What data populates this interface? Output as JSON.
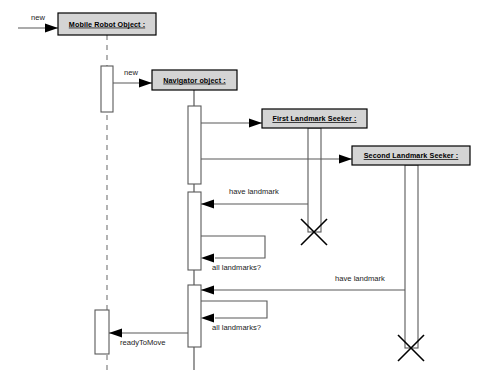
{
  "diagram": {
    "type": "uml-sequence-diagram",
    "width": 503,
    "height": 375,
    "background_color": "#ffffff",
    "colors": {
      "object_box_fill": "#d4d4d4",
      "object_box_stroke": "#000000",
      "activation_fill": "#ffffff",
      "activation_stroke": "#5a5a5a",
      "line": "#585858",
      "dashed_lifeline": "#8a8a8a",
      "arrowhead": "#000000",
      "text": "#1a1a1a"
    },
    "lifelines": [
      {
        "id": "mobile_robot",
        "label": "Mobile Robot Object :",
        "box": {
          "x": 58,
          "y": 13,
          "w": 98,
          "h": 22
        },
        "lifeline_x": 107,
        "lifeline_style": "dashed",
        "lifeline_top": 35,
        "lifeline_bottom": 370,
        "activations": [
          {
            "x": 101,
            "y": 66,
            "w": 12,
            "h": 46
          },
          {
            "x": 95,
            "y": 310,
            "w": 14,
            "h": 44
          }
        ]
      },
      {
        "id": "navigator",
        "label": "Navigator object :",
        "box": {
          "x": 152,
          "y": 70,
          "w": 85,
          "h": 20
        },
        "lifeline_x": 194,
        "lifeline_style": "solid",
        "lifeline_top": 90,
        "lifeline_bottom": 370,
        "activations": [
          {
            "x": 188,
            "y": 106,
            "w": 13,
            "h": 78
          },
          {
            "x": 188,
            "y": 192,
            "w": 13,
            "h": 78
          },
          {
            "x": 188,
            "y": 285,
            "w": 13,
            "h": 62
          }
        ]
      },
      {
        "id": "first_seeker",
        "label": "First Landmark Seeker :",
        "box": {
          "x": 262,
          "y": 109,
          "w": 105,
          "h": 19
        },
        "lifeline_x": 314,
        "lifeline_style": "solid",
        "lifeline_top": 128,
        "lifeline_bottom": 232,
        "activations": [
          {
            "x": 308,
            "y": 128,
            "w": 13,
            "h": 104
          }
        ],
        "destroyed": true,
        "destroy_y": 232
      },
      {
        "id": "second_seeker",
        "label": "Second Landmark Seeker :",
        "box": {
          "x": 352,
          "y": 146,
          "w": 118,
          "h": 19
        },
        "lifeline_x": 411,
        "lifeline_style": "solid",
        "lifeline_top": 165,
        "lifeline_bottom": 348,
        "activations": [
          {
            "x": 405,
            "y": 165,
            "w": 13,
            "h": 183
          }
        ],
        "destroyed": true,
        "destroy_y": 348
      }
    ],
    "messages": [
      {
        "id": "msg_new_robot",
        "label": "new",
        "kind": "create",
        "from_x": 18,
        "to_x": 58,
        "y": 28,
        "label_x": 38,
        "label_y": 20,
        "label_anchor": "middle"
      },
      {
        "id": "msg_new_navigator",
        "label": "new",
        "kind": "create",
        "from_x": 113,
        "to_x": 152,
        "y": 83,
        "label_x": 131,
        "label_y": 75,
        "label_anchor": "middle"
      },
      {
        "id": "msg_create_first_seeker",
        "label": "",
        "kind": "create",
        "from_x": 201,
        "to_x": 262,
        "y": 123,
        "label_x": 231,
        "label_y": 117,
        "label_anchor": "middle"
      },
      {
        "id": "msg_create_second_seeker",
        "label": "",
        "kind": "create",
        "from_x": 201,
        "to_x": 352,
        "y": 159,
        "label_x": 276,
        "label_y": 153,
        "label_anchor": "middle"
      },
      {
        "id": "msg_have_landmark_1",
        "label": "have landmark",
        "kind": "return-call",
        "from_x": 308,
        "to_x": 201,
        "y": 204,
        "label_x": 254,
        "label_y": 194,
        "label_anchor": "middle"
      },
      {
        "id": "msg_all_landmarks_1",
        "label": "all landmarks?",
        "kind": "self-call",
        "base_x": 201,
        "loop_x": 265,
        "y_top": 236,
        "y_bottom": 258,
        "label_x": 212,
        "label_y": 270,
        "label_anchor": "start"
      },
      {
        "id": "msg_have_landmark_2",
        "label": "have landmark",
        "kind": "return-call",
        "from_x": 405,
        "to_x": 201,
        "y": 290,
        "label_x": 360,
        "label_y": 281,
        "label_anchor": "middle"
      },
      {
        "id": "msg_all_landmarks_2",
        "label": "all landmarks?",
        "kind": "self-call",
        "base_x": 201,
        "loop_x": 267,
        "y_top": 301,
        "y_bottom": 318,
        "label_x": 212,
        "label_y": 330,
        "label_anchor": "start"
      },
      {
        "id": "msg_ready_to_move",
        "label": "readyToMove",
        "kind": "return-call",
        "from_x": 188,
        "to_x": 109,
        "y": 333,
        "label_x": 120,
        "label_y": 345,
        "label_anchor": "start"
      }
    ]
  }
}
